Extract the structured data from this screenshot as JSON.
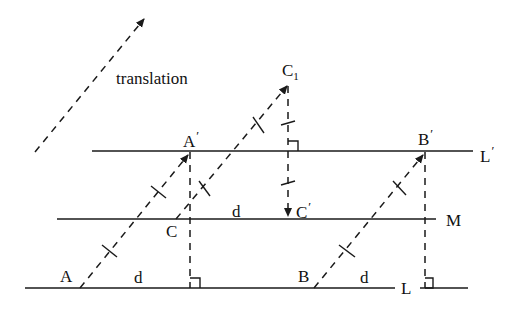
{
  "diagram": {
    "title_label": "translation",
    "lines": {
      "L_prime": {
        "label": "L",
        "prime": "′"
      },
      "M": {
        "label": "M"
      },
      "L": {
        "label": "L"
      }
    },
    "points": {
      "A": {
        "label": "A"
      },
      "A_prime": {
        "label": "A",
        "prime": "′"
      },
      "B": {
        "label": "B"
      },
      "B_prime": {
        "label": "B",
        "prime": "′"
      },
      "C": {
        "label": "C"
      },
      "C_prime": {
        "label": "C",
        "prime": "′"
      },
      "C1": {
        "label": "C",
        "sub": "1"
      }
    },
    "distances": {
      "d_between_L_and_M_left": "d",
      "d_between_M_and_L_prime": "d",
      "d_on_L_right": "d"
    },
    "colors": {
      "stroke": "#1a1a1a",
      "background": "#ffffff"
    }
  }
}
